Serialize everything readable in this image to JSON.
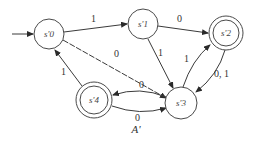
{
  "diagram": {
    "type": "finite-state-automaton",
    "caption": "A'",
    "states": [
      {
        "id": "s0",
        "label": "s'0",
        "accepting": false,
        "start": true
      },
      {
        "id": "s1",
        "label": "s'1",
        "accepting": false,
        "start": false
      },
      {
        "id": "s2",
        "label": "s'2",
        "accepting": true,
        "start": false
      },
      {
        "id": "s3",
        "label": "s'3",
        "accepting": false,
        "start": false
      },
      {
        "id": "s4",
        "label": "s'4",
        "accepting": true,
        "start": false
      }
    ],
    "transitions": [
      {
        "from": "s0",
        "to": "s1",
        "label": "1"
      },
      {
        "from": "s1",
        "to": "s2",
        "label": "0"
      },
      {
        "from": "s0",
        "to": "s3",
        "label": "0"
      },
      {
        "from": "s1",
        "to": "s3",
        "label": "1"
      },
      {
        "from": "s3",
        "to": "s2",
        "label": "1"
      },
      {
        "from": "s2",
        "to": "s3",
        "label": "0, 1"
      },
      {
        "from": "s3",
        "to": "s4",
        "label": "0"
      },
      {
        "from": "s4",
        "to": "s3",
        "label": "0"
      },
      {
        "from": "s4",
        "to": "s0",
        "label": "1"
      }
    ]
  }
}
